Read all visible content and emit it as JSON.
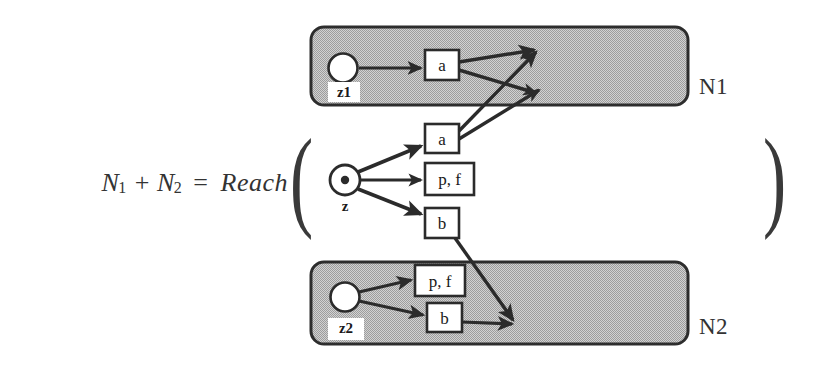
{
  "figure": {
    "equation": {
      "lhs_term1": "N",
      "lhs_term1_sub": "1",
      "plus": "+",
      "lhs_term2": "N",
      "lhs_term2_sub": "2",
      "equals": "=",
      "function_name": "Reach",
      "paren_open": "(",
      "paren_close": ")"
    },
    "regions": [
      {
        "id": "n1",
        "label": "N1"
      },
      {
        "id": "n2",
        "label": "N2"
      }
    ],
    "nodes": {
      "start_n1": "z1",
      "start_root": "z",
      "start_n2": "z2"
    },
    "boxes": {
      "n1_a": "a",
      "root_a": "a",
      "root_pf": "p, f",
      "root_b": "b",
      "n2_pf": "p, f",
      "n2_b": "b"
    },
    "colors": {
      "region_fill": "#b8b8b8",
      "region_stroke": "#2d2d2d",
      "line": "#2b2b2b",
      "box_fill": "#ffffff",
      "text": "#1a1a1a",
      "page_background": "#ffffff"
    }
  }
}
